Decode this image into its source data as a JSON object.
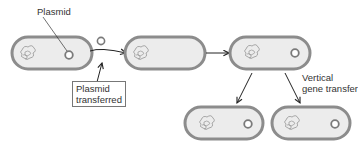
{
  "labels": {
    "plasmid": "Plasmid",
    "plasmid_transferred_line1": "Plasmid",
    "plasmid_transferred_line2": "transferred",
    "vertical_line1": "Vertical",
    "vertical_line2": "gene transfer"
  },
  "colors": {
    "cell_border": "#8c8c8c",
    "cell_fill": "#ececec",
    "plasmid_ring": "#7a7a7a",
    "arrow": "#222222",
    "text": "#333333"
  },
  "cells": [
    {
      "id": "donor",
      "x": 12,
      "y": 37,
      "w": 80,
      "h": 32,
      "has_plasmid": true
    },
    {
      "id": "recipient",
      "x": 125,
      "y": 37,
      "w": 80,
      "h": 32,
      "has_plasmid": false
    },
    {
      "id": "transformed",
      "x": 230,
      "y": 37,
      "w": 80,
      "h": 32,
      "has_plasmid": true
    },
    {
      "id": "daughter-1",
      "x": 185,
      "y": 107,
      "w": 78,
      "h": 32,
      "has_plasmid": true
    },
    {
      "id": "daughter-2",
      "x": 272,
      "y": 107,
      "w": 78,
      "h": 32,
      "has_plasmid": true
    }
  ]
}
